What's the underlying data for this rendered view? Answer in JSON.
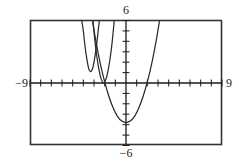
{
  "figure": {
    "kind": "graphing-calculator-viewport",
    "frame": {
      "x_min": 30,
      "y_min": 20,
      "x_max": 222,
      "y_max": 145
    },
    "origin_px": {
      "x": 126,
      "y": 83
    },
    "px_per_unit": {
      "x": 10.67,
      "y": 10.42
    }
  },
  "labels": {
    "top": "6",
    "bottom": "−6",
    "left": "−9",
    "right": "9"
  },
  "chart_data": {
    "type": "line",
    "title": "",
    "xlabel": "",
    "ylabel": "",
    "xlim": [
      -9,
      9
    ],
    "ylim": [
      -6,
      6
    ],
    "grid": false,
    "legend": "none",
    "xticks": [
      -9,
      -8,
      -7,
      -6,
      -5,
      -4,
      -3,
      -2,
      -1,
      0,
      1,
      2,
      3,
      4,
      5,
      6,
      7,
      8,
      9
    ],
    "yticks": [
      -6,
      -5,
      -4,
      -3,
      -2,
      -1,
      0,
      1,
      2,
      3,
      4,
      5,
      6
    ],
    "tick_labels_shown": [
      "6",
      "-6",
      "-9",
      "9"
    ],
    "series": [
      {
        "name": "narrow-parabola-left",
        "shape": "parabola",
        "vertex": [
          -3.3,
          1.1
        ],
        "a": 9.0,
        "x_range": [
          -4.2,
          -2.4
        ],
        "points": [
          [
            -4.15,
            6.0
          ],
          [
            -4.0,
            5.0
          ],
          [
            -3.85,
            3.6
          ],
          [
            -3.7,
            2.5
          ],
          [
            -3.5,
            1.4
          ],
          [
            -3.3,
            1.1
          ],
          [
            -3.1,
            1.5
          ],
          [
            -2.95,
            2.3
          ],
          [
            -2.8,
            3.3
          ],
          [
            -2.65,
            4.6
          ],
          [
            -2.5,
            6.0
          ]
        ]
      },
      {
        "name": "narrow-parabola-middle",
        "shape": "parabola",
        "vertex": [
          -2.1,
          0.0
        ],
        "a": 5.6,
        "x_range": [
          -3.15,
          -1.05
        ],
        "points": [
          [
            -3.1,
            6.0
          ],
          [
            -2.9,
            3.9
          ],
          [
            -2.7,
            2.3
          ],
          [
            -2.5,
            1.1
          ],
          [
            -2.3,
            0.3
          ],
          [
            -2.1,
            0.0
          ],
          [
            -1.9,
            0.3
          ],
          [
            -1.7,
            1.1
          ],
          [
            -1.5,
            2.3
          ],
          [
            -1.3,
            3.9
          ],
          [
            -1.1,
            6.0
          ]
        ]
      },
      {
        "name": "wide-parabola",
        "shape": "parabola",
        "vertex": [
          0.0,
          -3.8
        ],
        "a": 0.98,
        "x_range": [
          -3.2,
          3.2
        ],
        "points": [
          [
            -3.15,
            6.0
          ],
          [
            -2.8,
            3.9
          ],
          [
            -2.4,
            1.8
          ],
          [
            -2.0,
            0.1
          ],
          [
            -1.6,
            -1.3
          ],
          [
            -1.2,
            -2.4
          ],
          [
            -0.8,
            -3.2
          ],
          [
            -0.4,
            -3.65
          ],
          [
            0.0,
            -3.8
          ],
          [
            0.4,
            -3.65
          ],
          [
            0.8,
            -3.2
          ],
          [
            1.2,
            -2.4
          ],
          [
            1.6,
            -1.3
          ],
          [
            2.0,
            0.1
          ],
          [
            2.4,
            1.8
          ],
          [
            2.8,
            3.9
          ],
          [
            3.15,
            6.0
          ]
        ]
      }
    ]
  },
  "style": {
    "frame_color": "#333333",
    "axis_color": "#1a1a1a",
    "curve_color": "#2b2b2b",
    "label_color": "#1a1a1a",
    "background": "#ffffff"
  }
}
